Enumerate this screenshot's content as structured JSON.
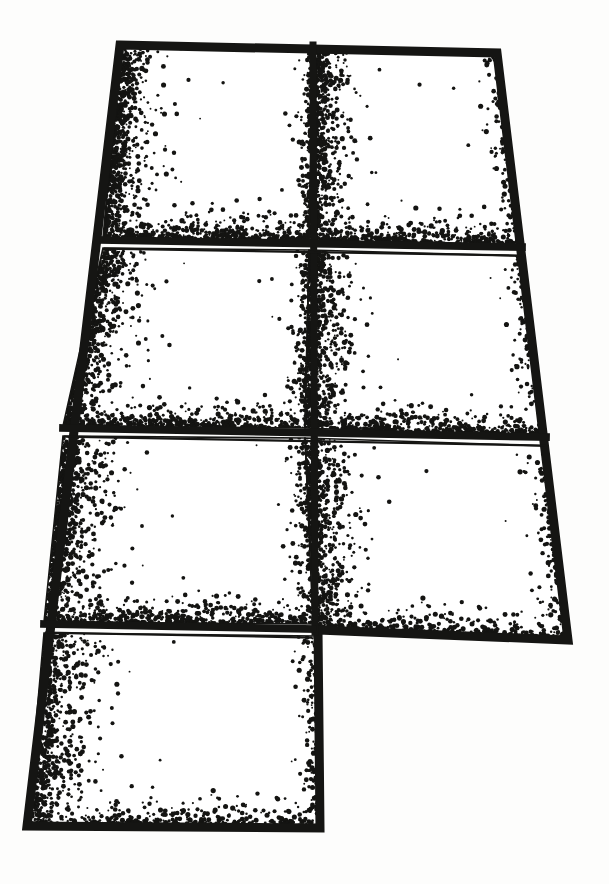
{
  "figure": {
    "style": {
      "ink_color": "#151513",
      "panel_fill": "#ffffff",
      "paper_color": "#fdfdfc",
      "stipple_color": "#141412",
      "frame_thickness_px": 9,
      "inner_hairline_thickness_px": 1.6
    },
    "canvas": {
      "width": 609,
      "height": 884
    },
    "outline": {
      "name": "assembly-outline",
      "vertices": [
        {
          "label": "top-left",
          "x": 120,
          "y": 45
        },
        {
          "label": "top-right",
          "x": 497,
          "y": 53
        },
        {
          "label": "right-bottom",
          "x": 568,
          "y": 640
        },
        {
          "label": "mid-step-right",
          "x": 318,
          "y": 630
        },
        {
          "label": "bottom-right-lower",
          "x": 320,
          "y": 828
        },
        {
          "label": "bottom-left-lower",
          "x": 27,
          "y": 826
        }
      ]
    },
    "dividers": {
      "vertical": [
        {
          "name": "center-vertical-divider",
          "x_top": 313,
          "y_top": 45,
          "x_bottom": 315,
          "y_bottom": 632
        }
      ],
      "horizontal": [
        {
          "name": "divider-row-1",
          "x_left": 103,
          "y_left": 240,
          "x_right": 522,
          "y_right": 247
        },
        {
          "name": "divider-row-2",
          "x_left": 63,
          "y_left": 428,
          "x_right": 546,
          "y_right": 437
        },
        {
          "name": "divider-row-3",
          "x_left": 44,
          "y_left": 624,
          "x_right": 313,
          "y_right": 629
        }
      ]
    },
    "panels": [
      {
        "id": "panel-1",
        "row": 1,
        "column": "left",
        "corners": [
          [
            120,
            45
          ],
          [
            313,
            47
          ],
          [
            309,
            240
          ],
          [
            103,
            238
          ]
        ]
      },
      {
        "id": "panel-2",
        "row": 1,
        "column": "right",
        "corners": [
          [
            313,
            47
          ],
          [
            497,
            53
          ],
          [
            522,
            247
          ],
          [
            309,
            240
          ]
        ]
      },
      {
        "id": "panel-3",
        "row": 2,
        "column": "left",
        "corners": [
          [
            103,
            248
          ],
          [
            309,
            250
          ],
          [
            305,
            428
          ],
          [
            63,
            426
          ]
        ]
      },
      {
        "id": "panel-4",
        "row": 2,
        "column": "right",
        "corners": [
          [
            309,
            250
          ],
          [
            522,
            256
          ],
          [
            546,
            437
          ],
          [
            305,
            428
          ]
        ]
      },
      {
        "id": "panel-5",
        "row": 3,
        "column": "left",
        "corners": [
          [
            63,
            436
          ],
          [
            305,
            438
          ],
          [
            313,
            624
          ],
          [
            44,
            622
          ]
        ]
      },
      {
        "id": "panel-6",
        "row": 3,
        "column": "right",
        "corners": [
          [
            305,
            438
          ],
          [
            546,
            446
          ],
          [
            568,
            640
          ],
          [
            315,
            631
          ]
        ]
      },
      {
        "id": "panel-7",
        "row": 4,
        "column": "left",
        "corners": [
          [
            44,
            633
          ],
          [
            315,
            636
          ],
          [
            320,
            828
          ],
          [
            27,
            826
          ]
        ]
      }
    ],
    "panel_count": 7,
    "labels": {
      "panel_count_text": "7 panels",
      "row_count_text": "4 rows",
      "column_count_text": "2 columns"
    }
  }
}
